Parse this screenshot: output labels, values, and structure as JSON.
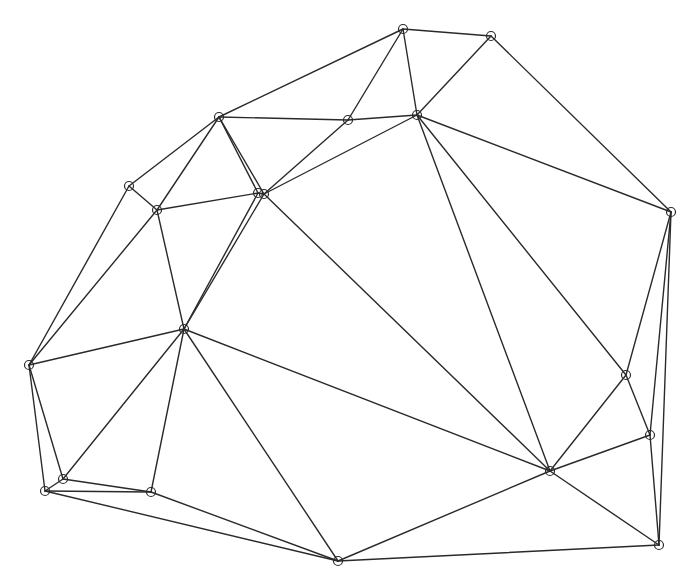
{
  "diagram": {
    "type": "planar-graph-triangulation",
    "width": 697,
    "height": 587,
    "background": "#ffffff",
    "stroke_color": "#2a2a2a",
    "node_radius": 4.5,
    "nodes": [
      {
        "id": "A",
        "x": 403,
        "y": 29
      },
      {
        "id": "B",
        "x": 491,
        "y": 36
      },
      {
        "id": "C",
        "x": 219,
        "y": 117
      },
      {
        "id": "D",
        "x": 348,
        "y": 120
      },
      {
        "id": "E",
        "x": 417,
        "y": 115
      },
      {
        "id": "F",
        "x": 258,
        "y": 193
      },
      {
        "id": "G",
        "x": 264,
        "y": 194
      },
      {
        "id": "H",
        "x": 129,
        "y": 186
      },
      {
        "id": "I",
        "x": 157,
        "y": 210
      },
      {
        "id": "J",
        "x": 671,
        "y": 212
      },
      {
        "id": "K",
        "x": 184,
        "y": 329
      },
      {
        "id": "L",
        "x": 29,
        "y": 365
      },
      {
        "id": "M",
        "x": 626,
        "y": 375
      },
      {
        "id": "N",
        "x": 650,
        "y": 435
      },
      {
        "id": "O",
        "x": 550,
        "y": 471
      },
      {
        "id": "P",
        "x": 63,
        "y": 479
      },
      {
        "id": "Q",
        "x": 45,
        "y": 491
      },
      {
        "id": "R",
        "x": 151,
        "y": 492
      },
      {
        "id": "S",
        "x": 338,
        "y": 561
      },
      {
        "id": "T",
        "x": 659,
        "y": 545
      }
    ],
    "edges": [
      [
        "A",
        "B"
      ],
      [
        "A",
        "C"
      ],
      [
        "A",
        "D"
      ],
      [
        "A",
        "E"
      ],
      [
        "B",
        "E"
      ],
      [
        "B",
        "J"
      ],
      [
        "C",
        "D"
      ],
      [
        "C",
        "H"
      ],
      [
        "C",
        "I"
      ],
      [
        "C",
        "F"
      ],
      [
        "C",
        "G"
      ],
      [
        "D",
        "E"
      ],
      [
        "D",
        "G"
      ],
      [
        "E",
        "G"
      ],
      [
        "E",
        "J"
      ],
      [
        "E",
        "O"
      ],
      [
        "E",
        "M"
      ],
      [
        "F",
        "G"
      ],
      [
        "F",
        "I"
      ],
      [
        "F",
        "K"
      ],
      [
        "G",
        "K"
      ],
      [
        "G",
        "O"
      ],
      [
        "H",
        "I"
      ],
      [
        "H",
        "L"
      ],
      [
        "I",
        "K"
      ],
      [
        "I",
        "L"
      ],
      [
        "J",
        "M"
      ],
      [
        "J",
        "N"
      ],
      [
        "J",
        "T"
      ],
      [
        "K",
        "L"
      ],
      [
        "K",
        "P"
      ],
      [
        "K",
        "R"
      ],
      [
        "K",
        "S"
      ],
      [
        "K",
        "O"
      ],
      [
        "L",
        "P"
      ],
      [
        "L",
        "Q"
      ],
      [
        "M",
        "N"
      ],
      [
        "M",
        "O"
      ],
      [
        "N",
        "O"
      ],
      [
        "N",
        "T"
      ],
      [
        "O",
        "S"
      ],
      [
        "O",
        "T"
      ],
      [
        "P",
        "Q"
      ],
      [
        "P",
        "R"
      ],
      [
        "Q",
        "R"
      ],
      [
        "Q",
        "S"
      ],
      [
        "R",
        "S"
      ],
      [
        "S",
        "T"
      ]
    ]
  }
}
